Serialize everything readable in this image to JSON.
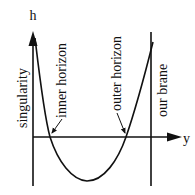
{
  "diagram": {
    "type": "potential-plot",
    "axes": {
      "vertical_label": "h",
      "horizontal_label": "y"
    },
    "labels": {
      "singularity": "singularity",
      "inner_horizon": "inner horizon",
      "outer_horizon": "outer horizon",
      "our_brane": "our brane"
    },
    "colors": {
      "stroke": "#111111",
      "background": "#ffffff"
    }
  }
}
